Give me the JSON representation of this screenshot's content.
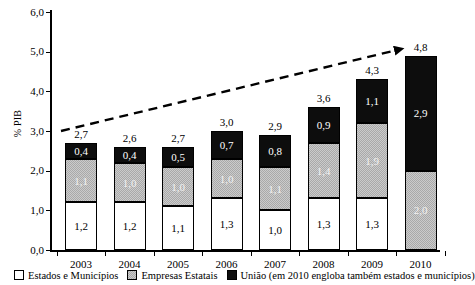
{
  "chart_data": {
    "type": "bar",
    "subtype": "stacked-bar-with-trend-arrow",
    "title": "",
    "xlabel": "",
    "ylabel": "% PIB",
    "ylim": [
      0.0,
      6.0
    ],
    "ytick_labels": [
      "0,0",
      "1,0",
      "2,0",
      "3,0",
      "4,0",
      "5,0",
      "6,0"
    ],
    "ytick_values": [
      0.0,
      1.0,
      2.0,
      3.0,
      4.0,
      5.0,
      6.0
    ],
    "grid": false,
    "legend_position": "bottom",
    "decimal_separator": ",",
    "categories": [
      "2003",
      "2004",
      "2005",
      "2006",
      "2007",
      "2008",
      "2009",
      "2010"
    ],
    "series": [
      {
        "name": "Estados e Municípios",
        "color": "#ffffff",
        "values": [
          1.2,
          1.2,
          1.1,
          1.3,
          1.0,
          1.3,
          1.3,
          null
        ],
        "labels": [
          "1,2",
          "1,2",
          "1,1",
          "1,3",
          "1,0",
          "1,3",
          "1,3",
          ""
        ]
      },
      {
        "name": "Empresas Estatais",
        "color": "#a9a9a9",
        "values": [
          1.1,
          1.0,
          1.0,
          1.0,
          1.1,
          1.4,
          1.9,
          2.0
        ],
        "labels": [
          "1,1",
          "1,0",
          "1,0",
          "1,0",
          "1,1",
          "1,4",
          "1,9",
          "2,0"
        ]
      },
      {
        "name": "União (em 2010 engloba também estados e municípios)",
        "color": "#0d0d0d",
        "values": [
          0.4,
          0.4,
          0.5,
          0.7,
          0.8,
          0.9,
          1.1,
          2.9
        ],
        "labels": [
          "0,4",
          "0,4",
          "0,5",
          "0,7",
          "0,8",
          "0,9",
          "1,1",
          "2,9"
        ]
      }
    ],
    "totals": [
      2.7,
      2.6,
      2.7,
      3.0,
      2.9,
      3.6,
      4.3,
      4.8
    ],
    "total_labels": [
      "2,7",
      "2,6",
      "2,7",
      "3,0",
      "2,9",
      "3,6",
      "4,3",
      "4,8"
    ],
    "annotations": [
      {
        "type": "arrow",
        "style": "dashed",
        "color": "#000000",
        "description": "upward trend arrow from 2003 to 2010"
      }
    ]
  },
  "legend": {
    "items": [
      {
        "label": "Estados e Municípios",
        "swatch": "white"
      },
      {
        "label": "Empresas Estatais",
        "swatch": "grey"
      },
      {
        "label": "União (em 2010 engloba também estados e municípios)",
        "swatch": "black"
      }
    ]
  }
}
